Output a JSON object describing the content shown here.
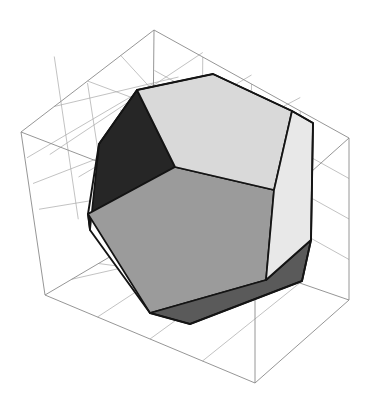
{
  "figure": {
    "caption": "",
    "background_color": "#ffffff",
    "width": 382,
    "height": 403
  },
  "bounding_box": {
    "name": "wireframe-cuboid",
    "edge_color": "#8a8a8a",
    "grid_color": "#a8a8a8",
    "grid_divisions": 4,
    "grid_faces": [
      "top",
      "bottom",
      "back-left",
      "back-right"
    ],
    "corners": {
      "front_bottom": [
        255,
        383
      ],
      "left_bottom": [
        45,
        295
      ],
      "right_bottom": [
        349,
        300
      ],
      "back_bottom": [
        152,
        232
      ],
      "front_top": [
        255,
        222
      ],
      "left_top": [
        21,
        132
      ],
      "right_top": [
        349,
        138
      ],
      "back_top": [
        154,
        30
      ]
    }
  },
  "solid": {
    "name": "dodecahedron",
    "edge_color": "#141414",
    "edge_width": 1.7,
    "visible_face_count": 5,
    "faces": [
      {
        "id": "front-pentagon",
        "label": "Front pentagon",
        "fill": "#9b9b9b",
        "shading": "medium gray",
        "opaque": true,
        "points": "88,214 175,167 274,190 266,280 150,313"
      },
      {
        "id": "top-pentagon",
        "label": "Top pentagon",
        "fill": "#cfcfcf",
        "shading": "light gray",
        "opaque": false,
        "points": "137,90 213,74 292,111 274,190 175,167"
      },
      {
        "id": "right-pentagon",
        "label": "Right pentagon",
        "fill": "#e2e2e2",
        "shading": "very light gray",
        "opaque": false,
        "points": "292,111 313,123 311,240 266,280 274,190"
      },
      {
        "id": "left-pentagon",
        "label": "Left pentagon",
        "fill": "#262626",
        "shading": "near black",
        "opaque": true,
        "points": "137,90 175,167 88,214 90,230 99,144"
      },
      {
        "id": "bottom-right-pentagon",
        "label": "Bottom-right pentagon",
        "fill": "#5a5a5a",
        "shading": "dark gray",
        "opaque": true,
        "points": "266,280 311,240 302,281 190,324 150,313"
      }
    ],
    "silhouette": "213,74 292,111 313,123 311,240 302,281 190,324 150,313 90,230 88,214 99,144 137,90"
  }
}
